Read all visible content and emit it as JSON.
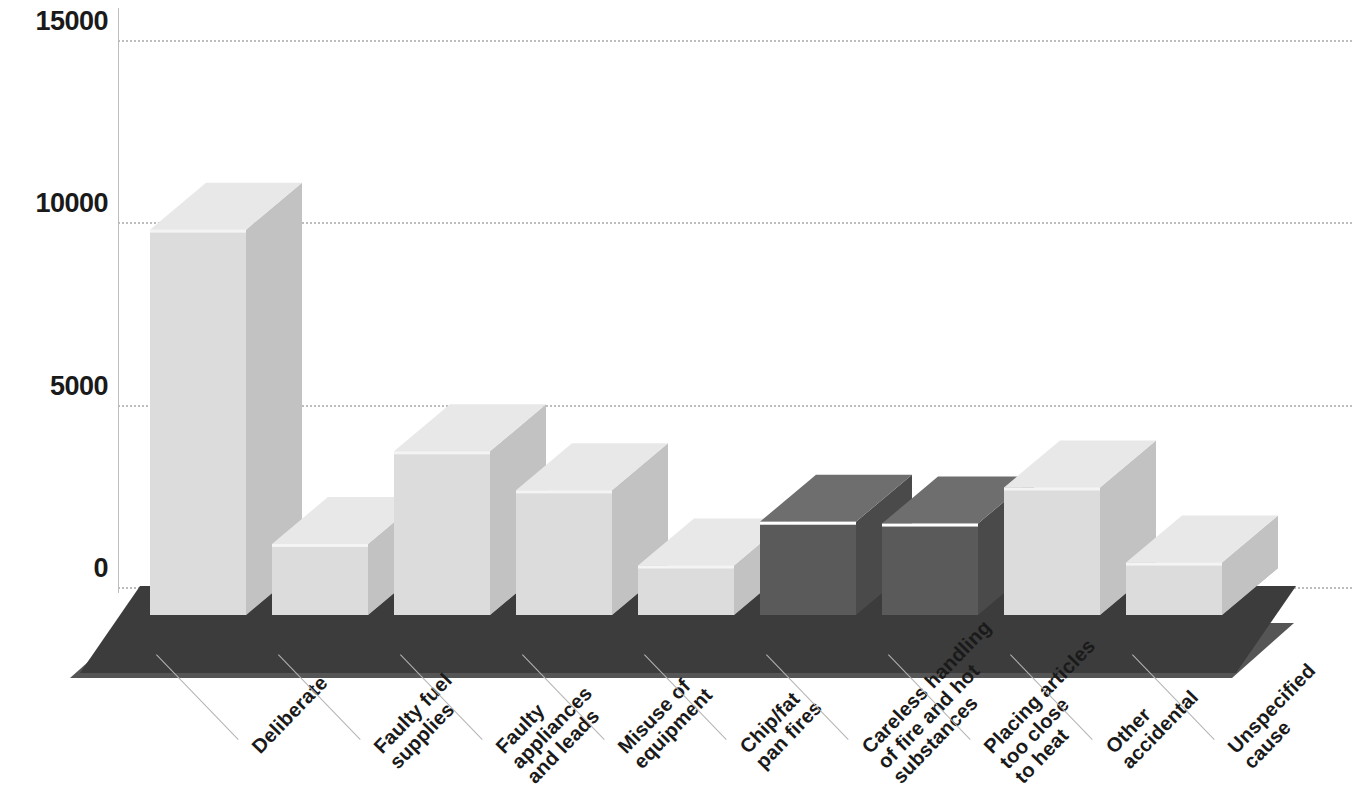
{
  "chart_data": {
    "type": "bar",
    "title": "",
    "subtitle": "",
    "xlabel": "",
    "ylabel": "",
    "categories": [
      "Deliberate",
      "Faulty fuel supplies",
      "Faulty appliances and leads",
      "Misuse of equipment",
      "Chip/fat pan fires",
      "Careless handling of fire and hot substances",
      "Placing articles too close to heat",
      "Other accidental",
      "Unspecified cause"
    ],
    "category_lines": [
      [
        "Deliberate"
      ],
      [
        "Faulty fuel",
        "supplies"
      ],
      [
        "Faulty",
        "appliances",
        "and leads"
      ],
      [
        "Misuse of",
        "equipment"
      ],
      [
        "Chip/fat",
        "pan fires"
      ],
      [
        "Careless handling",
        "of fire and hot",
        "substances"
      ],
      [
        "Placing articles",
        "too close",
        "to heat"
      ],
      [
        "Other",
        "accidental"
      ],
      [
        "Unspecified",
        "cause"
      ]
    ],
    "values": [
      9800,
      1180,
      3720,
      2650,
      590,
      1790,
      1740,
      2730,
      670
    ],
    "ylim": [
      0,
      15000
    ],
    "yticks": [
      0,
      5000,
      10000,
      15000
    ],
    "ytick_labels": [
      "0",
      "5000",
      "10000",
      "15000"
    ],
    "grid": true,
    "legend": "none",
    "style": "3d-column",
    "bar_shades": [
      "light",
      "light",
      "light",
      "light",
      "light",
      "dark",
      "dark",
      "light",
      "light"
    ]
  },
  "colors": {
    "background": "#ffffff",
    "gridline": "#bdbdbd",
    "axis": "#bdbdbd",
    "tick_text": "#1a1a1a",
    "label_text": "#1a1a1a",
    "leader_line": "#b4b4b4",
    "floor_top": "#3c3c3c",
    "floor_front": "#2b2b2b",
    "floor_side": "#555555",
    "bar_light_top": "#e8e8e8",
    "bar_light_front": "#dcdcdc",
    "bar_light_side": "#c2c2c2",
    "bar_light_base": "#a9a9a9",
    "bar_dark_top": "#6e6e6e",
    "bar_dark_front": "#5a5a5a",
    "bar_dark_side": "#4a4a4a",
    "bar_dark_base": "#3f3f3f"
  },
  "axis_geometry": {
    "y_zero_px": 587,
    "y_top_px": 40,
    "px_per_unit": 0.0364
  }
}
